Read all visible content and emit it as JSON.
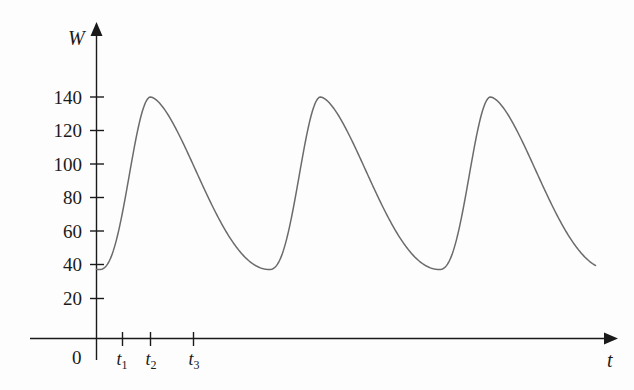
{
  "chart_data": {
    "type": "line",
    "title": "",
    "xlabel": "t",
    "ylabel": "W",
    "grid": false,
    "legend": false,
    "origin_label": "0",
    "ylim": [
      0,
      155
    ],
    "yticks": [
      20,
      40,
      60,
      80,
      100,
      120,
      140
    ],
    "ytick_labels": [
      "20",
      "40",
      "60",
      "80",
      "100",
      "120",
      "140"
    ],
    "xticks": [
      1,
      2,
      3
    ],
    "xtick_labels": [
      "t₁",
      "t₂",
      "t₃"
    ],
    "xtick_bases": [
      "t",
      "t",
      "t"
    ],
    "xtick_subscripts": [
      "1",
      "2",
      "3"
    ],
    "series": [
      {
        "name": "W",
        "minimum": 40,
        "maximum": 140,
        "amplitude": 50,
        "midline": 90,
        "cycles": 3,
        "peak_value": 140,
        "trough_value": 40,
        "start_value": 40,
        "end_value": 40
      }
    ],
    "curve_color": "#6b6b6b",
    "axis_color": "#1a1a1a"
  },
  "axes": {
    "y_axis_title": "W",
    "x_axis_title": "t"
  }
}
